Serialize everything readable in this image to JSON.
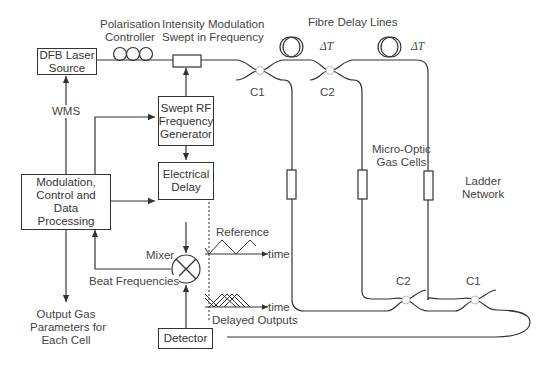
{
  "diagram": {
    "boxes": {
      "laser": "DFB Laser Source",
      "rf_generator": "Swept RF Frequency Generator",
      "processing": "Modulation, Control and Data Processing",
      "electrical_delay": "Electrical Delay",
      "detector": "Detector"
    },
    "labels": {
      "polarisation_controller": [
        "Polarisation",
        "Controller"
      ],
      "intensity_modulation": [
        "Intensity Modulation",
        "Swept in Frequency"
      ],
      "fibre_delay_lines": "Fibre Delay Lines",
      "delta_t_1": "ΔT",
      "delta_t_2": "ΔT",
      "c1_top": "C1",
      "c2_top": "C2",
      "c2_bottom": "C2",
      "c1_bottom": "C1",
      "wms": "WMS",
      "micro_optic": [
        "Micro-Optic",
        "Gas Cells"
      ],
      "ladder_network": [
        "Ladder",
        "Network"
      ],
      "mixer": "Mixer",
      "beat_frequencies": "Beat Frequencies",
      "reference": "Reference",
      "time_1": "time",
      "time_2": "time",
      "delayed_outputs": "Delayed Outputs",
      "output_gas": [
        "Output Gas",
        "Parameters for",
        "Each Cell"
      ]
    },
    "colors": {
      "line": "#333333",
      "text": "#444444",
      "coupler": "#bbbbbb"
    }
  }
}
